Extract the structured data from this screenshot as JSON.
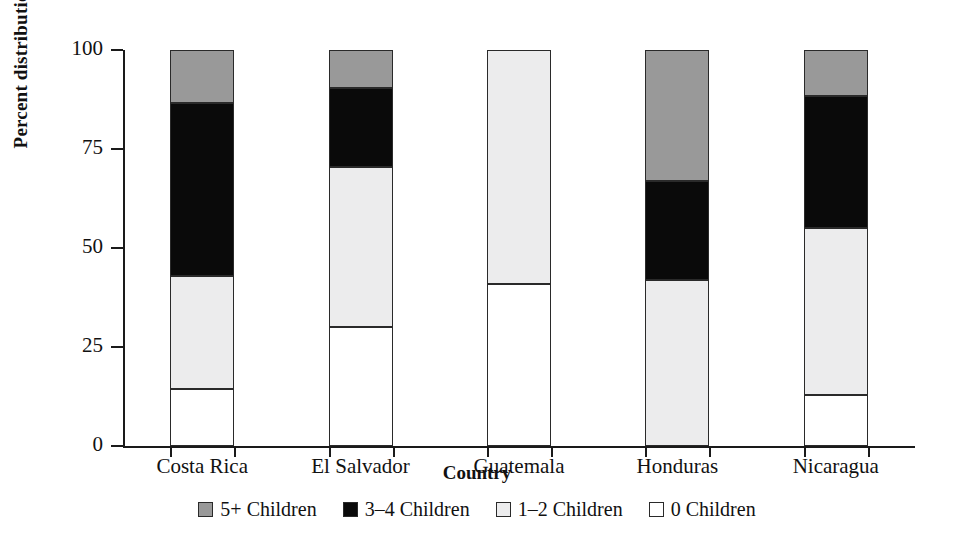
{
  "chart_data": {
    "type": "bar",
    "stacked": true,
    "title": "",
    "xlabel": "Country",
    "ylabel": "Percent distribution",
    "categories": [
      "Costa Rica",
      "El Salvador",
      "Guatemala",
      "Honduras",
      "Nicaragua"
    ],
    "yticks": [
      0,
      25,
      50,
      75,
      100
    ],
    "ylim": [
      0,
      100
    ],
    "grid": false,
    "legend_position": "bottom",
    "series": [
      {
        "name": "0 Children",
        "color": "#ffffff",
        "values": [
          14.5,
          30.0,
          41.0,
          0.0,
          13.0
        ]
      },
      {
        "name": "1-2 Children",
        "color": "#ececed",
        "values": [
          28.5,
          40.5,
          59.0,
          42.0,
          42.0
        ]
      },
      {
        "name": "3-4 Children",
        "color": "#0a0a0a",
        "values": [
          43.5,
          20.0,
          0.0,
          25.0,
          33.5
        ]
      },
      {
        "name": "5+ Children",
        "color": "#999999",
        "values": [
          13.5,
          9.5,
          0.0,
          33.0,
          11.5
        ]
      }
    ]
  },
  "legend": {
    "items": [
      {
        "label": "5+ Children",
        "swatch": "gray"
      },
      {
        "label": "3–4 Children",
        "swatch": "black"
      },
      {
        "label": "1–2 Children",
        "swatch": "light"
      },
      {
        "label": "0 Children",
        "swatch": "white"
      }
    ]
  },
  "axis": {
    "y_title": "Percent distribution",
    "x_title": "Country",
    "y_tick_labels": [
      "0",
      "25",
      "50",
      "75",
      "100"
    ],
    "x_tick_labels": [
      "Costa Rica",
      "El Salvador",
      "Guatemala",
      "Honduras",
      "Nicaragua"
    ]
  }
}
